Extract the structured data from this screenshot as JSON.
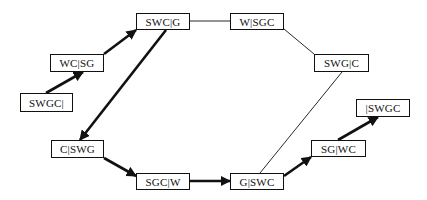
{
  "diagram": {
    "type": "state-space-graph",
    "nodes": [
      {
        "id": "n1",
        "label": "SWGC|",
        "x": 20,
        "y": 93,
        "w": 53,
        "h": 19
      },
      {
        "id": "n2",
        "label": "WC|SG",
        "x": 50,
        "y": 54,
        "w": 54,
        "h": 18
      },
      {
        "id": "n3",
        "label": "SWC|G",
        "x": 136,
        "y": 13,
        "w": 54,
        "h": 17
      },
      {
        "id": "n4",
        "label": "W|SGC",
        "x": 230,
        "y": 13,
        "w": 54,
        "h": 17
      },
      {
        "id": "n5",
        "label": "SWG|C",
        "x": 314,
        "y": 54,
        "w": 55,
        "h": 18
      },
      {
        "id": "n6",
        "label": "|SWGC",
        "x": 356,
        "y": 99,
        "w": 54,
        "h": 18
      },
      {
        "id": "n7",
        "label": "SG|WC",
        "x": 311,
        "y": 140,
        "w": 55,
        "h": 17
      },
      {
        "id": "n8",
        "label": "G|SWC",
        "x": 230,
        "y": 173,
        "w": 54,
        "h": 17
      },
      {
        "id": "n9",
        "label": "SGC|W",
        "x": 136,
        "y": 173,
        "w": 54,
        "h": 17
      },
      {
        "id": "n10",
        "label": "C|SWG",
        "x": 51,
        "y": 140,
        "w": 53,
        "h": 18
      }
    ],
    "edges": [
      {
        "from": "SWGC|",
        "to": "WC|SG",
        "style": "bold-arrow",
        "x1": 46,
        "y1": 93,
        "x2": 83,
        "y2": 72
      },
      {
        "from": "WC|SG",
        "to": "SWC|G",
        "style": "bold-arrow",
        "x1": 104,
        "y1": 54,
        "x2": 136,
        "y2": 30
      },
      {
        "from": "SWC|G",
        "to": "C|SWG",
        "style": "bold-arrow",
        "x1": 166,
        "y1": 30,
        "x2": 80,
        "y2": 140
      },
      {
        "from": "C|SWG",
        "to": "SGC|W",
        "style": "bold-arrow",
        "x1": 104,
        "y1": 158,
        "x2": 136,
        "y2": 176
      },
      {
        "from": "SGC|W",
        "to": "G|SWC",
        "style": "bold-arrow",
        "x1": 190,
        "y1": 181,
        "x2": 230,
        "y2": 181
      },
      {
        "from": "G|SWC",
        "to": "SG|WC",
        "style": "bold-arrow",
        "x1": 284,
        "y1": 176,
        "x2": 311,
        "y2": 157
      },
      {
        "from": "SG|WC",
        "to": "|SWGC",
        "style": "bold-arrow",
        "x1": 338,
        "y1": 140,
        "x2": 378,
        "y2": 117
      },
      {
        "from": "SWC|G",
        "to": "W|SGC",
        "style": "thin-line",
        "x1": 190,
        "y1": 21,
        "x2": 230,
        "y2": 21
      },
      {
        "from": "W|SGC",
        "to": "SWG|C",
        "style": "thin-line",
        "x1": 284,
        "y1": 29,
        "x2": 314,
        "y2": 54
      },
      {
        "from": "SWG|C",
        "to": "G|SWC",
        "style": "thin-line",
        "x1": 342,
        "y1": 72,
        "x2": 260,
        "y2": 173
      }
    ]
  }
}
